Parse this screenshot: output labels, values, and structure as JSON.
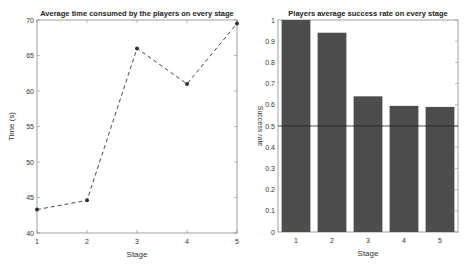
{
  "chart_data": [
    {
      "type": "line",
      "title": "Average time consumed by the players on every stage",
      "xlabel": "Stage",
      "ylabel": "Time (s)",
      "x": [
        1,
        2,
        3,
        4,
        5
      ],
      "values": [
        43.3,
        44.6,
        66,
        61,
        69.5
      ],
      "xlim": [
        1,
        5
      ],
      "ylim": [
        40,
        70
      ],
      "xticks": [
        1,
        2,
        3,
        4,
        5
      ],
      "yticks": [
        40,
        45,
        50,
        55,
        60,
        65,
        70
      ],
      "line_style": "dashed",
      "marker": "*",
      "grid": false,
      "color": "#333333"
    },
    {
      "type": "bar",
      "title": "Players average success rate on every stage",
      "xlabel": "Stage",
      "ylabel": "Success rate",
      "categories": [
        "1",
        "2",
        "3",
        "4",
        "5"
      ],
      "values": [
        1.0,
        0.94,
        0.64,
        0.595,
        0.59
      ],
      "ylim": [
        0,
        1
      ],
      "yticks": [
        0,
        0.1,
        0.2,
        0.3,
        0.4,
        0.5,
        0.6,
        0.7,
        0.8,
        0.9,
        1
      ],
      "reference_line": 0.5,
      "grid": false,
      "color": "#4d4d4d"
    }
  ]
}
